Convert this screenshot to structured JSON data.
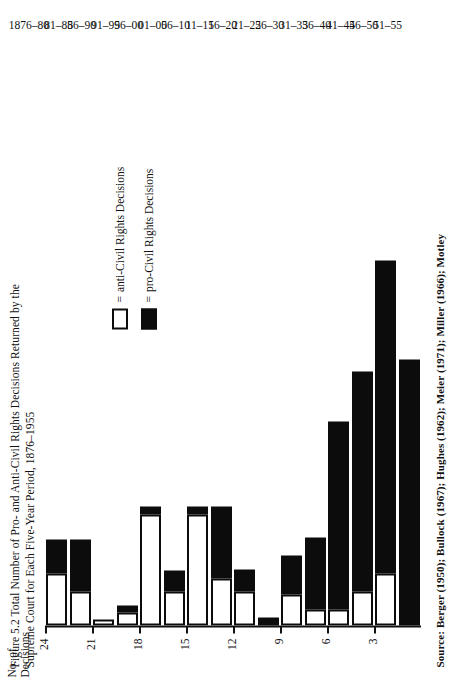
{
  "figure": {
    "caption_line1": "Figure 5.2  Total Number of Pro- and Anti-Civil Rights Decisions Returned by the",
    "caption_line2": "Supreme Court for Each Five-Year Period, 1876–1955",
    "source_note": "Source: Berger (1950); Bullock (1967); Hughes (1962); Meier (1971); Miller (1966); Motley",
    "axis_title_line1": "No. of",
    "axis_title_line2": "Decisions",
    "legend": [
      {
        "marker": "=",
        "label": "anti-Civil Rights Decisions",
        "style": "hollow"
      },
      {
        "marker": "=",
        "label": "pro-Civil Rights Decisions",
        "style": "filled"
      }
    ],
    "ink_color": "#0c0c0c",
    "paper_color": "#ffffff"
  },
  "chart_data": {
    "type": "bar",
    "orientation": "vertical-stacked-rotated",
    "title": "Figure 5.2  Total Number of Pro- and Anti-Civil Rights Decisions Returned by the Supreme Court for Each Five-Year Period, 1876–1955",
    "xlabel": "",
    "ylabel": "No. of Decisions",
    "ylim": [
      0,
      24
    ],
    "yticks": [
      3,
      6,
      9,
      12,
      15,
      18,
      21,
      24
    ],
    "grid": false,
    "legend_position": "inside-left",
    "categories": [
      "1876–80",
      "81–85",
      "86–90",
      "91–95",
      "96–00",
      "01–05",
      "06–10",
      "11–15",
      "16–20",
      "21–25",
      "26–30",
      "31–35",
      "36–40",
      "41–45",
      "46–50",
      "51–55"
    ],
    "series": [
      {
        "name": "pro-Civil Rights Decisions",
        "style": "filled",
        "values": [
          2.2,
          3.3,
          0,
          0.5,
          0.5,
          1.3,
          0.5,
          4.6,
          1.4,
          0.5,
          2.5,
          4.6,
          12,
          14,
          20,
          17
        ]
      },
      {
        "name": "anti-Civil Rights Decisions",
        "style": "hollow",
        "values": [
          3.3,
          2.2,
          0.4,
          0.8,
          7.1,
          2.2,
          7.1,
          3,
          2.2,
          0,
          2,
          1,
          1,
          2.2,
          3.3,
          0
        ]
      }
    ],
    "totals": [
      5.5,
      5.5,
      0.4,
      1.3,
      7.6,
      3.5,
      7.6,
      7.6,
      3.6,
      0.5,
      4.5,
      5.6,
      13,
      16.2,
      23.3,
      17.2
    ]
  }
}
